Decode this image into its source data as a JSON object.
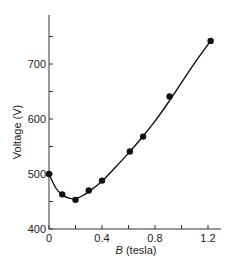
{
  "chart_data": {
    "type": "scatter",
    "title": "",
    "xlabel": "B (tesla)",
    "xlabel_italic_part": "B",
    "xlabel_rest": " (tesla)",
    "ylabel": "Voltage (V)",
    "xlim": [
      0,
      1.3
    ],
    "ylim": [
      400,
      780
    ],
    "grid": false,
    "legend": null,
    "x_ticks": [
      0,
      0.2,
      0.4,
      0.6,
      0.8,
      1.0,
      1.2
    ],
    "x_tick_labels": [
      "0",
      "",
      "0.4",
      "",
      "0.8",
      "",
      "1.2"
    ],
    "y_ticks": [
      400,
      450,
      500,
      550,
      600,
      650,
      700,
      750
    ],
    "y_tick_labels": [
      "400",
      "",
      "500",
      "",
      "600",
      "",
      "700",
      ""
    ],
    "series": [
      {
        "name": "measured",
        "marker": "filled-circle",
        "x": [
          0,
          0.1,
          0.2,
          0.3,
          0.4,
          0.61,
          0.71,
          0.91,
          1.22
        ],
        "y": [
          500,
          463,
          453,
          470,
          488,
          541,
          568,
          641,
          742
        ]
      },
      {
        "name": "fit-curve",
        "line": "smooth",
        "x": [
          0,
          0.05,
          0.1,
          0.15,
          0.2,
          0.25,
          0.3,
          0.4,
          0.5,
          0.6,
          0.7,
          0.8,
          0.9,
          1.0,
          1.1,
          1.22
        ],
        "y": [
          500,
          475,
          462,
          456,
          455,
          460,
          468,
          487,
          512,
          538,
          566,
          596,
          630,
          666,
          702,
          742
        ]
      }
    ],
    "colors": {
      "axis": "#333333",
      "data": "#111111",
      "background": "#ffffff"
    }
  }
}
